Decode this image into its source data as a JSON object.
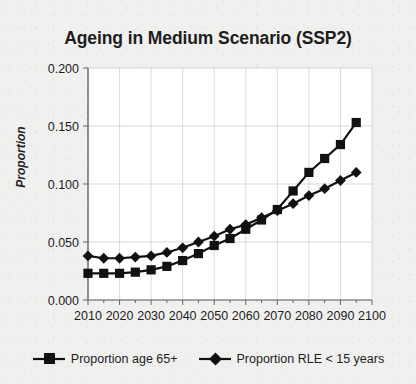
{
  "chart_data": {
    "type": "line",
    "title": "Ageing in Medium Scenario (SSP2)",
    "xlabel": "",
    "ylabel": "Proportion",
    "xlim": [
      2010,
      2100
    ],
    "ylim": [
      0.0,
      0.2
    ],
    "grid": true,
    "legend_position": "bottom",
    "xticks": [
      "2010",
      "2020",
      "2030",
      "2040",
      "2050",
      "2060",
      "2070",
      "2080",
      "2090",
      "2100"
    ],
    "xtick_values": [
      2010,
      2020,
      2030,
      2040,
      2050,
      2060,
      2070,
      2080,
      2090,
      2100
    ],
    "yticks": [
      "0.000",
      "0.050",
      "0.100",
      "0.150",
      "0.200"
    ],
    "ytick_values": [
      0.0,
      0.05,
      0.1,
      0.15,
      0.2
    ],
    "x": [
      2010,
      2015,
      2020,
      2025,
      2030,
      2035,
      2040,
      2045,
      2050,
      2055,
      2060,
      2065,
      2070,
      2075,
      2080,
      2085,
      2090,
      2095
    ],
    "series": [
      {
        "name": "Proportion age 65+",
        "marker": "square",
        "color": "#111111",
        "values": [
          0.023,
          0.023,
          0.023,
          0.024,
          0.026,
          0.029,
          0.034,
          0.04,
          0.047,
          0.053,
          0.061,
          0.069,
          0.078,
          0.094,
          0.11,
          0.122,
          0.134,
          0.153
        ]
      },
      {
        "name": "Proportion RLE < 15 years",
        "marker": "diamond",
        "color": "#111111",
        "values": [
          0.038,
          0.036,
          0.036,
          0.037,
          0.038,
          0.041,
          0.045,
          0.05,
          0.055,
          0.061,
          0.065,
          0.071,
          0.077,
          0.083,
          0.09,
          0.096,
          0.103,
          0.11
        ]
      }
    ]
  },
  "legend": {
    "entries": [
      {
        "label": "Proportion age 65+",
        "marker": "square"
      },
      {
        "label": "Proportion RLE < 15 years",
        "marker": "diamond"
      }
    ]
  }
}
